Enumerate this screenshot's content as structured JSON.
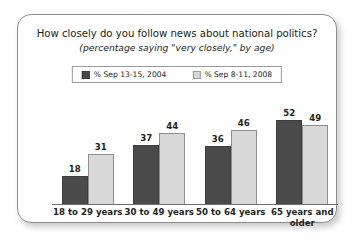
{
  "chart_data": {
    "type": "bar",
    "title": "How closely do you follow news about national politics?",
    "subtitle": "(percentage saying \"very closely,\" by age)",
    "xlabel": "",
    "ylabel": "",
    "ylim": [
      0,
      60
    ],
    "grid": false,
    "legend_position": "top-center",
    "categories": [
      "18 to 29 years",
      "30 to 49 years",
      "50 to 64 years",
      "65 years and older"
    ],
    "series": [
      {
        "name": "% Sep 13-15, 2004",
        "color": "#4a4a4a",
        "values": [
          18,
          37,
          36,
          52
        ]
      },
      {
        "name": "% Sep 8-11, 2008",
        "color": "#d8d8d8",
        "values": [
          31,
          44,
          46,
          49
        ]
      }
    ]
  },
  "legend": {
    "entries": [
      {
        "label": "% Sep 13-15, 2004",
        "swatch": "dark"
      },
      {
        "label": "% Sep 8-11, 2008",
        "swatch": "light"
      }
    ]
  }
}
